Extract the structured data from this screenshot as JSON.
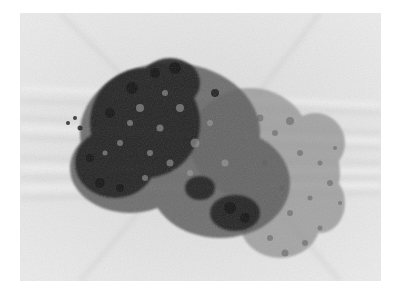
{
  "image": {
    "alt": "Grayscale rendering of a dense porous cluster on a light streaked background",
    "subject": "porous-cluster",
    "background_color": "#e6e6e6",
    "core_color": "#1c1c1c",
    "mid_color": "#6e6e6e",
    "fringe_color": "#9a9a9a",
    "page_color": "#ffffff"
  }
}
